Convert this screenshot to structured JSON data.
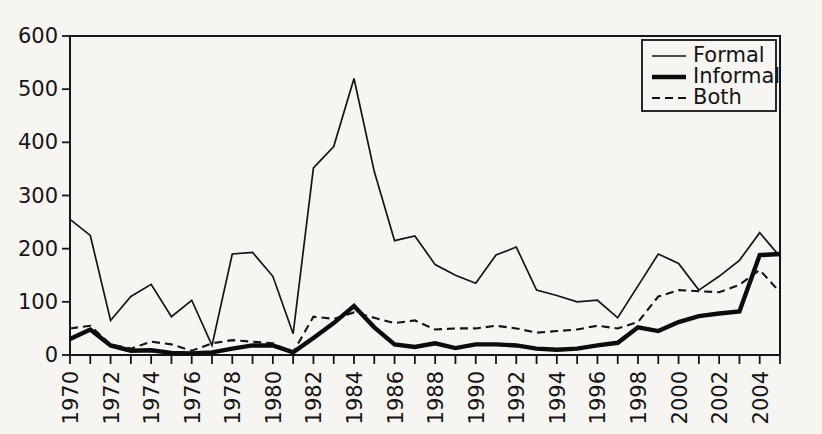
{
  "chart_data": {
    "type": "line",
    "title": "",
    "xlabel": "",
    "ylabel": "",
    "xlim": [
      1970,
      2005
    ],
    "ylim": [
      0,
      600
    ],
    "grid": false,
    "legend_position": "top-right",
    "x": [
      1970,
      1971,
      1972,
      1973,
      1974,
      1975,
      1976,
      1977,
      1978,
      1979,
      1980,
      1981,
      1982,
      1983,
      1984,
      1985,
      1986,
      1987,
      1988,
      1989,
      1990,
      1991,
      1992,
      1993,
      1994,
      1995,
      1996,
      1997,
      1998,
      1999,
      2000,
      2001,
      2002,
      2003,
      2004,
      2005
    ],
    "xtick_labels": [
      "1970",
      "1972",
      "1974",
      "1976",
      "1978",
      "1980",
      "1982",
      "1984",
      "1986",
      "1988",
      "1990",
      "1992",
      "1994",
      "1996",
      "1998",
      "2000",
      "2002",
      "2004"
    ],
    "ytick_labels": [
      "0",
      "100",
      "200",
      "300",
      "400",
      "500",
      "600"
    ],
    "ytick_values": [
      0,
      100,
      200,
      300,
      400,
      500,
      600
    ],
    "series": [
      {
        "name": "Formal",
        "style": "thin-solid",
        "color": "#141414",
        "values": [
          255,
          225,
          65,
          110,
          133,
          72,
          103,
          18,
          190,
          193,
          148,
          40,
          352,
          392,
          520,
          345,
          215,
          224,
          170,
          150,
          135,
          188,
          203,
          122,
          112,
          100,
          103,
          70,
          130,
          190,
          172,
          122,
          148,
          178,
          230,
          185
        ]
      },
      {
        "name": "Informal",
        "style": "thick-solid",
        "color": "#0c0c0c",
        "values": [
          30,
          48,
          18,
          8,
          9,
          4,
          3,
          5,
          12,
          18,
          18,
          5,
          32,
          60,
          92,
          52,
          20,
          15,
          22,
          13,
          20,
          20,
          18,
          12,
          10,
          12,
          18,
          23,
          52,
          45,
          62,
          73,
          78,
          82,
          188,
          190
        ]
      },
      {
        "name": "Both",
        "style": "dashed",
        "color": "#141414",
        "values": [
          50,
          55,
          20,
          12,
          25,
          20,
          8,
          22,
          28,
          25,
          22,
          5,
          72,
          68,
          80,
          70,
          60,
          65,
          48,
          50,
          50,
          55,
          50,
          42,
          45,
          48,
          55,
          50,
          62,
          110,
          122,
          120,
          118,
          132,
          160,
          118
        ]
      }
    ]
  },
  "legend": {
    "entries": [
      {
        "label": "Formal",
        "style": "thin-solid"
      },
      {
        "label": "Informal",
        "style": "thick-solid"
      },
      {
        "label": "Both",
        "style": "dashed"
      }
    ]
  },
  "colors": {
    "background": "#f7f5f2",
    "axis": "#161616",
    "text": "#141414"
  }
}
